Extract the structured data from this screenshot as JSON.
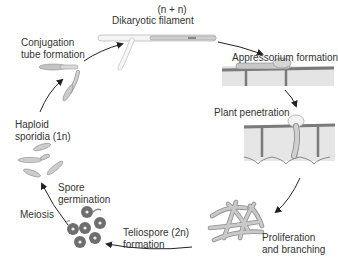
{
  "diagram": {
    "type": "life-cycle",
    "stages": [
      {
        "id": "dikaryotic",
        "label_line1": "(n + n)",
        "label_line2": "Dikaryotic filament"
      },
      {
        "id": "appressorium",
        "label_line1": "Appressorium formation"
      },
      {
        "id": "penetration",
        "label_line1": "Plant penetration"
      },
      {
        "id": "proliferation",
        "label_line1": "Proliferation",
        "label_line2": "and branching"
      },
      {
        "id": "teliospore",
        "label_line1": "Teliospore (2n)",
        "label_line2": "formation"
      },
      {
        "id": "meiosis",
        "label_line1": "Meiosis"
      },
      {
        "id": "germination",
        "label_line1": "Spore",
        "label_line2": "germination"
      },
      {
        "id": "haploid",
        "label_line1": "Haploid",
        "label_line2": "sporidia (1n)"
      },
      {
        "id": "conjugation",
        "label_line1": "Conjugation",
        "label_line2": "tube formation"
      }
    ],
    "colors": {
      "arrow": "#222222",
      "cell_fill": "#c8c8c8",
      "cell_stroke": "#8a8a8a",
      "plant_wall": "#7a7a7a",
      "plant_cell": "#e6e6e6",
      "spore": "#6e6e6e"
    }
  }
}
